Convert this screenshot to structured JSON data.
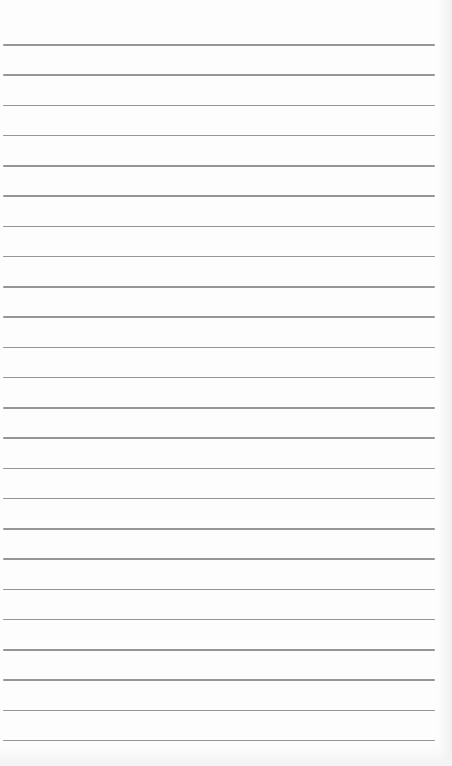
{
  "paper": {
    "type": "lined paper",
    "line_count": 24,
    "first_line_y": 44,
    "line_spacing": 30.26,
    "line_color": "#8a8a8a",
    "background_color": "#fdfdfd"
  }
}
